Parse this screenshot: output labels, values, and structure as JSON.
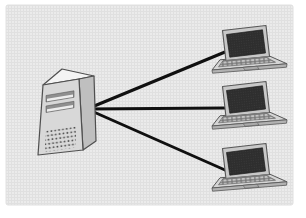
{
  "diagram": {
    "type": "star-network",
    "colors": {
      "page-bg": "#ffffff",
      "panel-bg": "#ebebeb",
      "panel-grid": "#e0e0e0",
      "connection": "#101010",
      "outline": "#4f4f4f",
      "server-front": "#d8d8d8",
      "server-top": "#f4f4f4",
      "server-side": "#bfbfbf",
      "slot-dark": "#8f8f8f",
      "slot-light": "#ededed",
      "vent": "#4d4d4d",
      "lid": "#c8c8c8",
      "laptop-outline": "#575757",
      "screen": "#2e2e2e",
      "screen-dot": "#3e3e3e",
      "deck": "#d5d5d5",
      "deck-lip": "#b2b2b2",
      "key-bg": "#6f6f6f",
      "key-cap": "#c4c4c4",
      "touchpad": "#ababab",
      "hinge": "#7a7a7a"
    },
    "nodes": [
      {
        "id": "server",
        "kind": "server-tower-icon",
        "transform": "translate(0,0)"
      },
      {
        "id": "laptop-1",
        "kind": "laptop-icon",
        "transform": "translate(0,-56)"
      },
      {
        "id": "laptop-2",
        "kind": "laptop-icon",
        "transform": "translate(0,0)"
      },
      {
        "id": "laptop-3",
        "kind": "laptop-icon",
        "transform": "translate(0,62)"
      }
    ],
    "edges": [
      {
        "from": "server",
        "to": "laptop-1",
        "x1": 87,
        "y1": 109,
        "x2": 225,
        "y2": 52
      },
      {
        "from": "server",
        "to": "laptop-2",
        "x1": 87,
        "y1": 109,
        "x2": 225,
        "y2": 108
      },
      {
        "from": "server",
        "to": "laptop-3",
        "x1": 87,
        "y1": 109,
        "x2": 225,
        "y2": 170
      }
    ]
  }
}
